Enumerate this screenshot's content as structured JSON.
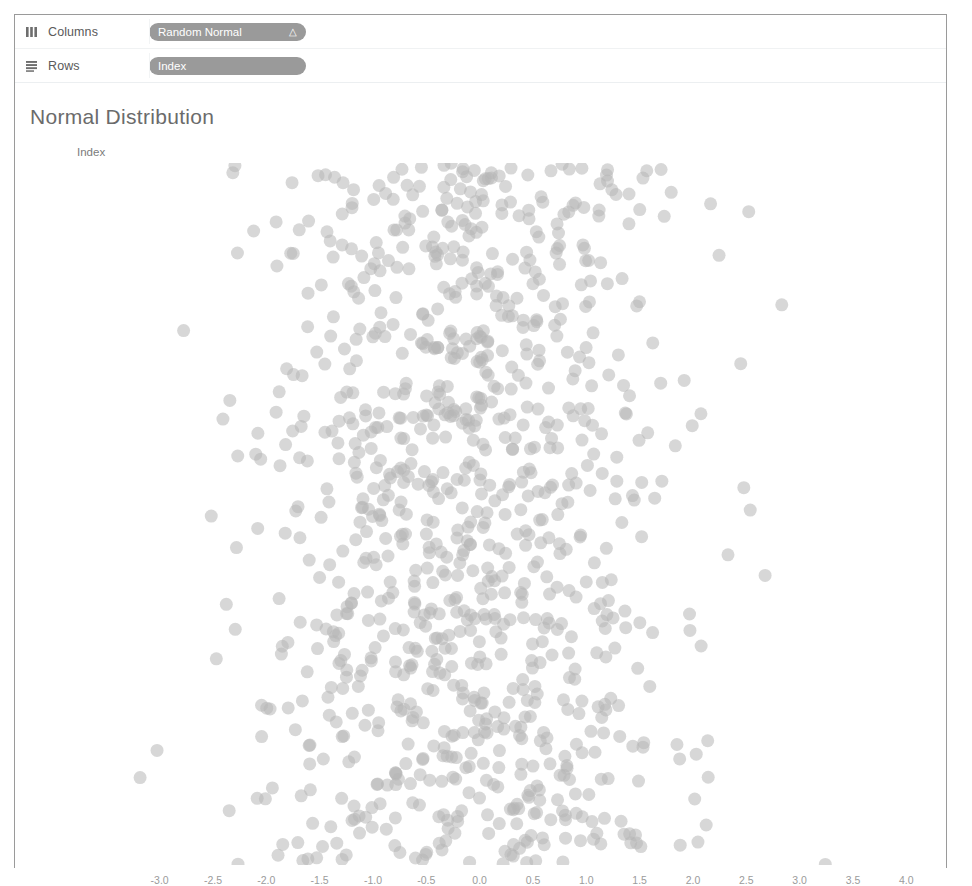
{
  "shelves": [
    {
      "icon": "columns-icon",
      "label": "Columns",
      "pill": {
        "text": "Random Normal",
        "badge": "△"
      }
    },
    {
      "icon": "rows-icon",
      "label": "Rows",
      "pill": {
        "text": "Index",
        "badge": ""
      }
    }
  ],
  "viz": {
    "title": "Normal Distribution",
    "row_header_label": "Index"
  },
  "colors": {
    "pill_background": "#9a9a9a",
    "pill_text": "#ffffff",
    "mark": "#b6b6b6",
    "title_text": "#6b6b6b",
    "axis_text": "#9b9b9b",
    "border": "#9a9a9a"
  },
  "chart_data": {
    "type": "scatter",
    "title": "Normal Distribution",
    "xlabel": "Random Normal",
    "ylabel": "Index",
    "xlim": [
      -3.25,
      4.25
    ],
    "ylim": [
      0,
      1000
    ],
    "grid": false,
    "legend": null,
    "xticks": [
      "-3.0",
      "-2.5",
      "-2.0",
      "-1.5",
      "-1.0",
      "-0.5",
      "0.0",
      "0.5",
      "1.0",
      "1.5",
      "2.0",
      "2.5",
      "3.0",
      "3.5",
      "4.0"
    ],
    "xtick_values": [
      -3.0,
      -2.5,
      -2.0,
      -1.5,
      -1.0,
      -0.5,
      0.0,
      0.5,
      1.0,
      1.5,
      2.0,
      2.5,
      3.0,
      3.5,
      4.0
    ],
    "ytick_values": [],
    "yticks": [],
    "series": [
      {
        "name": "Random Normal",
        "n_points": 1000,
        "x_distribution": {
          "kind": "normal",
          "mean": -0.05,
          "std": 1.0
        },
        "y_distribution": {
          "kind": "uniform",
          "min": 0,
          "max": 1000
        },
        "marker": {
          "shape": "circle",
          "diameter_px": 13,
          "color": "#b6b6b6",
          "opacity": 0.55
        },
        "seed": 20240513
      }
    ]
  }
}
